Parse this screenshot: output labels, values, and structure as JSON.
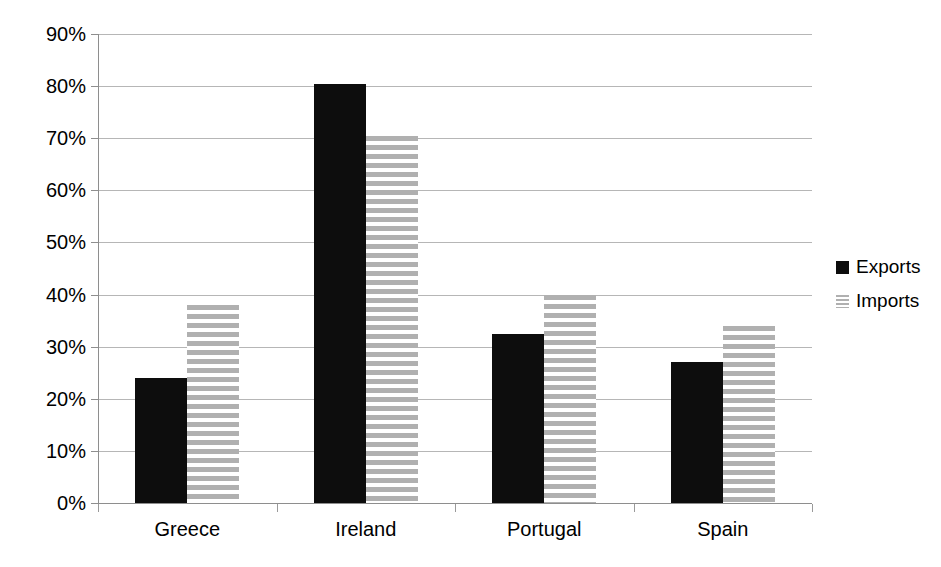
{
  "chart_data": {
    "type": "bar",
    "title": "",
    "subtitle": "",
    "xlabel": "",
    "ylabel": "",
    "categories": [
      "Greece",
      "Ireland",
      "Portugal",
      "Spain"
    ],
    "series": [
      {
        "name": "Exports",
        "color": "#0d0d0d",
        "fill": "solid",
        "values": [
          24,
          80.5,
          32.5,
          27
        ]
      },
      {
        "name": "Imports",
        "color": "#b0b0b0",
        "fill": "horizontal-stripes",
        "values": [
          38,
          70.5,
          40,
          34
        ]
      }
    ],
    "ylim": [
      0,
      90
    ],
    "ytick_values": [
      0,
      10,
      20,
      30,
      40,
      50,
      60,
      70,
      80,
      90
    ],
    "ytick_labels": [
      "0%",
      "10%",
      "20%",
      "30%",
      "40%",
      "50%",
      "60%",
      "70%",
      "80%",
      "90%"
    ],
    "value_suffix": "%",
    "grid": {
      "horizontal": true,
      "vertical": false,
      "color": "#b6b6b6"
    },
    "legend": {
      "position": "right",
      "entries": [
        "Exports",
        "Imports"
      ]
    },
    "background": "#ffffff"
  }
}
